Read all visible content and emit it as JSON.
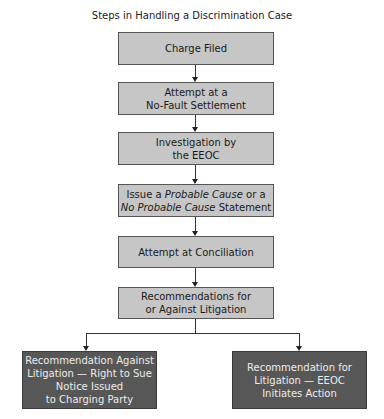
{
  "title": "Steps in Handling a Discrimination Case",
  "colors": {
    "step_fill": "#c6c6c6",
    "outcome_fill": "#575757",
    "outcome_text": "#ececec"
  },
  "steps": [
    {
      "lines": [
        "Charge Filed"
      ]
    },
    {
      "lines": [
        "Attempt at a",
        "No-Fault Settlement"
      ]
    },
    {
      "lines": [
        "Investigation by",
        "the EEOC"
      ]
    },
    {
      "line1_pre": "Issue a ",
      "line1_em": "Probable Cause",
      "line1_post": " or a",
      "line2_em": "No Probable Cause",
      "line2_post": " Statement"
    },
    {
      "lines": [
        "Attempt at Conciliation"
      ]
    },
    {
      "lines": [
        "Recommendations for",
        "or Against Litigation"
      ]
    }
  ],
  "outcomes": [
    {
      "lines": [
        "Recommendation Against",
        "Litigation — Right to Sue",
        "Notice Issued",
        "to Charging Party"
      ]
    },
    {
      "lines": [
        "Recommendation for",
        "Litigation — EEOC",
        "Initiates Action"
      ]
    }
  ]
}
